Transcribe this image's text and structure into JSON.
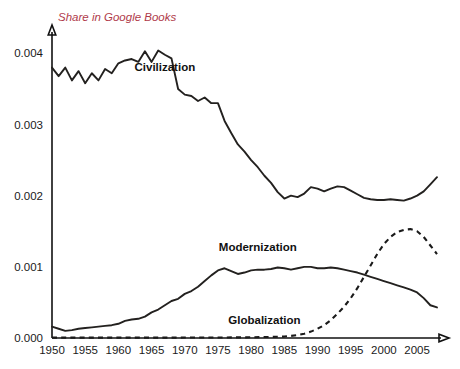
{
  "chart_data": {
    "type": "line",
    "title": "Share in Google Books",
    "xlabel": "",
    "ylabel": "Share in Google Books",
    "xlim": [
      1950,
      2008
    ],
    "ylim": [
      0.0,
      0.0043
    ],
    "grid": false,
    "legend_position": "inline-labels",
    "x_ticks": [
      "1950",
      "1955",
      "1960",
      "1965",
      "1970",
      "1975",
      "1980",
      "1985",
      "1990",
      "1995",
      "2000",
      "2005"
    ],
    "x_tick_values": [
      1950,
      1955,
      1960,
      1965,
      1970,
      1975,
      1980,
      1985,
      1990,
      1995,
      2000,
      2005
    ],
    "y_ticks": [
      "0.000",
      "0.001",
      "0.002",
      "0.003",
      "0.004"
    ],
    "y_tick_values": [
      0.0,
      0.001,
      0.002,
      0.003,
      0.004
    ],
    "series": [
      {
        "name": "Civilization",
        "style": "solid",
        "color": "#23211f",
        "label_x": 1967,
        "label_y": 0.00375,
        "x": [
          1950,
          1951,
          1952,
          1953,
          1954,
          1955,
          1956,
          1957,
          1958,
          1959,
          1960,
          1961,
          1962,
          1963,
          1964,
          1965,
          1966,
          1967,
          1968,
          1969,
          1970,
          1971,
          1972,
          1973,
          1974,
          1975,
          1976,
          1977,
          1978,
          1979,
          1980,
          1981,
          1982,
          1983,
          1984,
          1985,
          1986,
          1987,
          1988,
          1989,
          1990,
          1991,
          1992,
          1993,
          1994,
          1995,
          1996,
          1997,
          1998,
          1999,
          2000,
          2001,
          2002,
          2003,
          2004,
          2005,
          2006,
          2007,
          2008
        ],
        "values": [
          0.0038,
          0.00368,
          0.0038,
          0.00362,
          0.00375,
          0.00358,
          0.00372,
          0.00362,
          0.00378,
          0.00372,
          0.00386,
          0.0039,
          0.00392,
          0.00388,
          0.00403,
          0.00388,
          0.00404,
          0.00398,
          0.00393,
          0.0035,
          0.00342,
          0.0034,
          0.00333,
          0.00338,
          0.0033,
          0.0033,
          0.00305,
          0.00288,
          0.00272,
          0.00262,
          0.0025,
          0.0024,
          0.00228,
          0.00218,
          0.00205,
          0.00196,
          0.002,
          0.00198,
          0.00203,
          0.00212,
          0.0021,
          0.00206,
          0.0021,
          0.00213,
          0.00212,
          0.00207,
          0.00202,
          0.00197,
          0.00195,
          0.00194,
          0.00194,
          0.00195,
          0.00194,
          0.00193,
          0.00196,
          0.002,
          0.00206,
          0.00216,
          0.00226
        ]
      },
      {
        "name": "Modernization",
        "style": "solid",
        "color": "#23211f",
        "label_x": 1981,
        "label_y": 0.00122,
        "x": [
          1950,
          1951,
          1952,
          1953,
          1954,
          1955,
          1956,
          1957,
          1958,
          1959,
          1960,
          1961,
          1962,
          1963,
          1964,
          1965,
          1966,
          1967,
          1968,
          1969,
          1970,
          1971,
          1972,
          1973,
          1974,
          1975,
          1976,
          1977,
          1978,
          1979,
          1980,
          1981,
          1982,
          1983,
          1984,
          1985,
          1986,
          1987,
          1988,
          1989,
          1990,
          1991,
          1992,
          1993,
          1994,
          1995,
          1996,
          1997,
          1998,
          1999,
          2000,
          2001,
          2002,
          2003,
          2004,
          2005,
          2006,
          2007,
          2008
        ],
        "values": [
          0.00016,
          0.00013,
          0.0001,
          0.00011,
          0.00013,
          0.00014,
          0.00015,
          0.00016,
          0.00017,
          0.00018,
          0.0002,
          0.00024,
          0.00026,
          0.00027,
          0.0003,
          0.00036,
          0.0004,
          0.00046,
          0.00052,
          0.00055,
          0.00062,
          0.00066,
          0.00072,
          0.0008,
          0.00088,
          0.00095,
          0.00098,
          0.00094,
          0.0009,
          0.00092,
          0.00095,
          0.00096,
          0.00096,
          0.00097,
          0.00099,
          0.00098,
          0.00096,
          0.00098,
          0.001,
          0.001,
          0.00098,
          0.00098,
          0.00099,
          0.00098,
          0.00096,
          0.00094,
          0.00092,
          0.00089,
          0.00086,
          0.00083,
          0.0008,
          0.00077,
          0.00074,
          0.00071,
          0.00068,
          0.00064,
          0.00056,
          0.00046,
          0.00043
        ]
      },
      {
        "name": "Globalization",
        "style": "dashed",
        "color": "#1a1a1a",
        "label_x": 1982,
        "label_y": 0.0002,
        "x": [
          1950,
          1955,
          1960,
          1965,
          1970,
          1975,
          1980,
          1983,
          1985,
          1986,
          1987,
          1988,
          1989,
          1990,
          1991,
          1992,
          1993,
          1994,
          1995,
          1996,
          1997,
          1998,
          1999,
          2000,
          2001,
          2002,
          2003,
          2004,
          2005,
          2006,
          2007,
          2008
        ],
        "values": [
          5e-06,
          5e-06,
          5e-06,
          5e-06,
          6e-06,
          7e-06,
          1e-05,
          1.5e-05,
          2e-05,
          3e-05,
          4e-05,
          6e-05,
          9e-05,
          0.00013,
          0.00018,
          0.00025,
          0.00034,
          0.00044,
          0.00056,
          0.0007,
          0.00086,
          0.00102,
          0.00118,
          0.00132,
          0.00142,
          0.00149,
          0.00152,
          0.00153,
          0.0015,
          0.00142,
          0.0013,
          0.00118
        ]
      }
    ]
  }
}
